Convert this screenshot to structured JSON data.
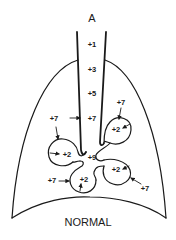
{
  "diagram": {
    "title": "A",
    "caption": "NORMAL",
    "airway_pressures": {
      "p1": "+1",
      "p3": "+3",
      "p5": "+5",
      "p7": "+7",
      "p9": "+9"
    },
    "alveoli": [
      {
        "name": "left",
        "inside": "+2",
        "outside": "+7"
      },
      {
        "name": "top-right",
        "inside": "+2",
        "outside": "+7"
      },
      {
        "name": "bottom-left",
        "inside": "+2",
        "outside": "+7"
      },
      {
        "name": "bottom-right",
        "inside": "+2",
        "outside": "+7"
      }
    ],
    "trachea_side_label": "+7",
    "colors": {
      "ink": "#1a1a1a",
      "background": "#ffffff"
    }
  }
}
